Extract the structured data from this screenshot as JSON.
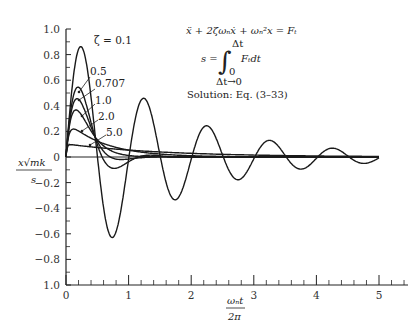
{
  "header": {
    "partial_caption": "(cut-off caption text above chart)"
  },
  "equation": {
    "line1": "ẍ + 2ζωₙẋ + ωₙ²x = Fₜ",
    "line2_lhs": "s =",
    "integral_upper": "Δt",
    "integral_lower": "0",
    "integrand": "Fₜdt",
    "limit": "Δt→0",
    "solution": "Solution: Eq. (3–33)"
  },
  "chart_data": {
    "type": "line",
    "title": "",
    "xlabel": "ωₙt / 2π",
    "ylabel": "x√(mk) / s",
    "xlabel_num": "ωₙt",
    "xlabel_den": "2π",
    "ylabel_num": "x√mk",
    "ylabel_den": "s",
    "xlim": [
      0,
      5.5
    ],
    "ylim": [
      -1.0,
      1.0
    ],
    "x_ticks": [
      0,
      1,
      2,
      3,
      4,
      5
    ],
    "x_tick_labels": [
      "0",
      "1",
      "2",
      "3",
      "4",
      "5"
    ],
    "x_minor_step": 0.2,
    "y_ticks": [
      1.0,
      0.8,
      0.6,
      0.4,
      0.2,
      0,
      -0.2,
      -0.4,
      -0.6,
      -0.8,
      -1.0
    ],
    "y_tick_labels": [
      "1.0",
      "0.8",
      "0.6",
      "0.4",
      "0.2",
      "0",
      "−0.2",
      "−0.4",
      "−0.6",
      "−0.8",
      "1.0"
    ],
    "y_minor_step": 0.1,
    "grid": false,
    "legend_position": "inline labels with leader arrows near peaks",
    "series": [
      {
        "name": "ζ = 0.1",
        "zeta": 0.1,
        "label": "ζ = 0.1",
        "peak": {
          "x": 0.22,
          "y": 0.86
        },
        "points": [
          [
            0,
            0
          ],
          [
            0.22,
            0.86
          ],
          [
            0.72,
            -0.61
          ],
          [
            1.22,
            0.45
          ],
          [
            1.72,
            -0.33
          ],
          [
            2.22,
            0.24
          ],
          [
            2.72,
            -0.18
          ],
          [
            3.22,
            0.13
          ],
          [
            3.72,
            -0.1
          ],
          [
            4.22,
            0.07
          ],
          [
            4.72,
            -0.05
          ],
          [
            5.0,
            0.0
          ]
        ]
      },
      {
        "name": "ζ = 0.5",
        "zeta": 0.5,
        "label": "0.5",
        "peak": {
          "x": 0.17,
          "y": 0.54
        },
        "points": [
          [
            0,
            0
          ],
          [
            0.17,
            0.54
          ],
          [
            0.5,
            0.16
          ],
          [
            0.75,
            -0.05
          ],
          [
            1.0,
            -0.07
          ],
          [
            1.5,
            -0.01
          ],
          [
            2.0,
            0.0
          ]
        ]
      },
      {
        "name": "ζ = 0.707",
        "zeta": 0.707,
        "label": "0.707",
        "peak": {
          "x": 0.14,
          "y": 0.46
        },
        "points": [
          [
            0,
            0
          ],
          [
            0.14,
            0.46
          ],
          [
            0.5,
            0.13
          ],
          [
            0.85,
            -0.02
          ],
          [
            1.2,
            -0.01
          ],
          [
            2.0,
            0.0
          ]
        ]
      },
      {
        "name": "ζ = 1.0",
        "zeta": 1.0,
        "label": "1.0",
        "peak": {
          "x": 0.16,
          "y": 0.37
        },
        "points": [
          [
            0,
            0
          ],
          [
            0.16,
            0.37
          ],
          [
            0.5,
            0.16
          ],
          [
            1.0,
            0.03
          ],
          [
            1.5,
            0.005
          ],
          [
            2.0,
            0.0
          ]
        ]
      },
      {
        "name": "ζ = 2.0",
        "zeta": 2.0,
        "label": "2.0",
        "peak": {
          "x": 0.1,
          "y": 0.21
        },
        "points": [
          [
            0,
            0
          ],
          [
            0.1,
            0.21
          ],
          [
            0.5,
            0.14
          ],
          [
            1.0,
            0.07
          ],
          [
            1.5,
            0.03
          ],
          [
            2.0,
            0.02
          ],
          [
            3.0,
            0.0
          ]
        ]
      },
      {
        "name": "ζ = 5.0",
        "zeta": 5.0,
        "label": "5.0",
        "peak": {
          "x": 0.05,
          "y": 0.1
        },
        "points": [
          [
            0,
            0
          ],
          [
            0.05,
            0.1
          ],
          [
            0.5,
            0.08
          ],
          [
            1.0,
            0.06
          ],
          [
            2.0,
            0.03
          ],
          [
            3.0,
            0.02
          ],
          [
            5.0,
            0.01
          ]
        ]
      }
    ]
  }
}
